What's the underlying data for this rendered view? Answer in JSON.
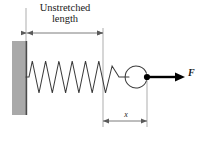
{
  "figure": {
    "background_color": "#ffffff",
    "width": 202,
    "height": 141
  },
  "labels": {
    "unstretched_line1": "Unstretched",
    "unstretched_line2": "length",
    "displacement": "x",
    "force": "F"
  },
  "colors": {
    "wall_fill": "#a9a9a9",
    "wall_edge": "#555555",
    "line": "#3b3b3b",
    "dimension_line": "#6b6b6b",
    "force_arrow": "#000000",
    "text": "#1a1a1a"
  },
  "elements": {
    "wall": {
      "name": "fixed-support-wall",
      "x": 12,
      "y": 41,
      "width": 15,
      "height": 74
    },
    "spring": {
      "name": "coil-spring",
      "start_x": 26,
      "end_x": 119,
      "center_y": 77,
      "amplitude": 16,
      "coils": 7
    },
    "hook": {
      "name": "spring-end-hook-loop",
      "center_x": 140,
      "center_y": 77,
      "radius": 11
    },
    "attachment_point": {
      "name": "force-application-point",
      "x": 147,
      "y": 77,
      "radius": 3
    },
    "force_arrow": {
      "name": "force-vector-arrow",
      "from_x": 147,
      "to_x": 183,
      "y": 77
    },
    "unstretched_dimension": {
      "name": "unstretched-length-dimension",
      "from_x": 27,
      "to_x": 103,
      "y": 33
    },
    "displacement_dimension": {
      "name": "displacement-dimension",
      "from_x": 103,
      "to_x": 147,
      "y": 121
    },
    "extension_lines": [
      {
        "name": "extension-line-wall",
        "x": 26,
        "y1": 8,
        "y2": 41
      },
      {
        "name": "extension-line-natural-length",
        "x": 103,
        "y1": 28,
        "y2": 127
      },
      {
        "name": "extension-line-stretched-end",
        "x": 147,
        "y1": 80,
        "y2": 127
      }
    ]
  }
}
